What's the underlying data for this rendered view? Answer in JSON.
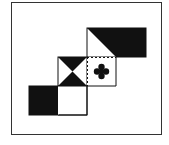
{
  "figure": {
    "type": "cube-net-puzzle",
    "colors": {
      "ink": "#111111",
      "frame": "#333333",
      "paper": "#ffffff"
    },
    "faces": [
      {
        "id": "top-left",
        "pattern": "diagonal-half-white-triangle",
        "fill": "black"
      },
      {
        "id": "top-right",
        "pattern": "solid",
        "fill": "black"
      },
      {
        "id": "middle-left",
        "pattern": "hourglass",
        "fill": "black-triangles-top-bottom"
      },
      {
        "id": "middle-right",
        "pattern": "clover",
        "fill": "white-with-black-clover"
      },
      {
        "id": "bottom-left",
        "pattern": "solid",
        "fill": "black"
      },
      {
        "id": "bottom-right",
        "pattern": "blank",
        "fill": "white"
      }
    ],
    "fold_lines": "dashed"
  }
}
